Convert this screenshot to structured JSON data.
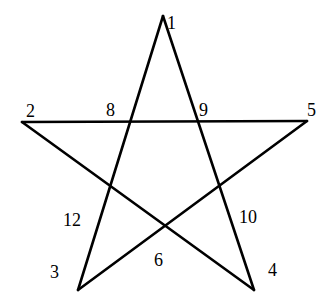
{
  "diagram": {
    "type": "pentagram",
    "stroke_color": "#000000",
    "background": "#ffffff",
    "vertices": {
      "v1": {
        "x": 163,
        "y": 16
      },
      "v2": {
        "x": 22,
        "y": 122
      },
      "v3": {
        "x": 78,
        "y": 290
      },
      "v4": {
        "x": 254,
        "y": 290
      },
      "v5": {
        "x": 307,
        "y": 121
      }
    },
    "edges": [
      {
        "from": "v1",
        "to": "v3"
      },
      {
        "from": "v1",
        "to": "v4"
      },
      {
        "from": "v2",
        "to": "v5"
      },
      {
        "from": "v2",
        "to": "v4"
      },
      {
        "from": "v5",
        "to": "v3"
      }
    ],
    "labels": [
      {
        "id": "label-1",
        "text": "1",
        "x": 167,
        "y": 29
      },
      {
        "id": "label-2",
        "text": "2",
        "x": 26,
        "y": 117
      },
      {
        "id": "label-8",
        "text": "8",
        "x": 106,
        "y": 116
      },
      {
        "id": "label-9",
        "text": "9",
        "x": 199,
        "y": 116
      },
      {
        "id": "label-5",
        "text": "5",
        "x": 307,
        "y": 116
      },
      {
        "id": "label-12",
        "text": "12",
        "x": 63,
        "y": 226
      },
      {
        "id": "label-10",
        "text": "10",
        "x": 239,
        "y": 223
      },
      {
        "id": "label-3",
        "text": "3",
        "x": 50,
        "y": 278
      },
      {
        "id": "label-6",
        "text": "6",
        "x": 154,
        "y": 266
      },
      {
        "id": "label-4",
        "text": "4",
        "x": 268,
        "y": 276
      }
    ]
  }
}
